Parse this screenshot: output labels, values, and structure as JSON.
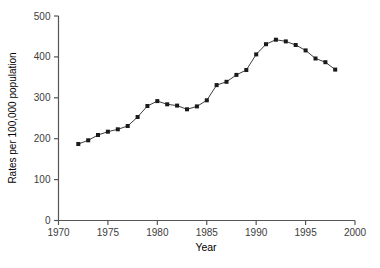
{
  "chart_data": {
    "type": "line",
    "title": "",
    "xlabel": "Year",
    "ylabel": "Rates per 100,000 population",
    "x": [
      1972,
      1973,
      1974,
      1975,
      1976,
      1977,
      1978,
      1979,
      1980,
      1981,
      1982,
      1983,
      1984,
      1985,
      1986,
      1987,
      1988,
      1989,
      1990,
      1991,
      1992,
      1993,
      1994,
      1995,
      1996,
      1997,
      1998
    ],
    "values": [
      187,
      196,
      209,
      217,
      223,
      231,
      253,
      280,
      292,
      284,
      281,
      272,
      279,
      294,
      331,
      339,
      356,
      368,
      406,
      431,
      442,
      438,
      429,
      416,
      396,
      387,
      369
    ],
    "xlim": [
      1970,
      2000
    ],
    "ylim": [
      0,
      500
    ],
    "xticks": [
      1970,
      1975,
      1980,
      1985,
      1990,
      1995,
      2000
    ],
    "yticks": [
      0,
      100,
      200,
      300,
      400,
      500
    ],
    "grid": false,
    "legend": false,
    "marker": "square",
    "colors": {
      "line": "#3f3f3f",
      "marker": "#1a1a1a",
      "axis": "#555555",
      "text": "#3c3c3c",
      "background": "#ffffff"
    }
  }
}
